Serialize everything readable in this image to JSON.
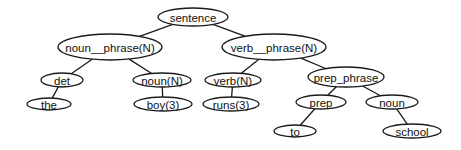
{
  "diagram": {
    "type": "parse-tree",
    "nodes": [
      {
        "id": "sentence",
        "label": "sentence",
        "cx": 193,
        "cy": 17,
        "rx": 35,
        "ry": 9
      },
      {
        "id": "noun_phrase",
        "label": "noun__phrase(N)",
        "cx": 110,
        "cy": 47,
        "rx": 52,
        "ry": 13
      },
      {
        "id": "verb_phrase",
        "label": "verb__phrase(N)",
        "cx": 274,
        "cy": 47,
        "rx": 52,
        "ry": 13
      },
      {
        "id": "det",
        "label": "det",
        "cx": 62,
        "cy": 80,
        "rx": 21,
        "ry": 7
      },
      {
        "id": "noun_n",
        "label": "noun(N)",
        "cx": 162,
        "cy": 80,
        "rx": 29,
        "ry": 7
      },
      {
        "id": "verb_n",
        "label": "verb(N)",
        "cx": 233,
        "cy": 80,
        "rx": 28,
        "ry": 7
      },
      {
        "id": "prep_phrase",
        "label": "prep_phrase",
        "cx": 346,
        "cy": 77,
        "rx": 38,
        "ry": 10
      },
      {
        "id": "the",
        "label": "the",
        "cx": 49,
        "cy": 104,
        "rx": 22,
        "ry": 6
      },
      {
        "id": "boy",
        "label": "boy(3)",
        "cx": 163,
        "cy": 104,
        "rx": 29,
        "ry": 7
      },
      {
        "id": "runs",
        "label": "runs(3)",
        "cx": 231,
        "cy": 104,
        "rx": 28,
        "ry": 7
      },
      {
        "id": "prep",
        "label": "prep",
        "cx": 321,
        "cy": 102,
        "rx": 25,
        "ry": 7
      },
      {
        "id": "noun",
        "label": "noun",
        "cx": 392,
        "cy": 102,
        "rx": 26,
        "ry": 7
      },
      {
        "id": "to",
        "label": "to",
        "cx": 295,
        "cy": 131,
        "rx": 21,
        "ry": 6
      },
      {
        "id": "school",
        "label": "school",
        "cx": 412,
        "cy": 131,
        "rx": 29,
        "ry": 7
      }
    ],
    "edges": [
      [
        "sentence",
        "noun_phrase"
      ],
      [
        "sentence",
        "verb_phrase"
      ],
      [
        "noun_phrase",
        "det"
      ],
      [
        "noun_phrase",
        "noun_n"
      ],
      [
        "verb_phrase",
        "verb_n"
      ],
      [
        "verb_phrase",
        "prep_phrase"
      ],
      [
        "det",
        "the"
      ],
      [
        "noun_n",
        "boy"
      ],
      [
        "verb_n",
        "runs"
      ],
      [
        "prep_phrase",
        "prep"
      ],
      [
        "prep_phrase",
        "noun"
      ],
      [
        "prep",
        "to"
      ],
      [
        "noun",
        "school"
      ]
    ],
    "colors": {
      "stroke": "#1a1a1a",
      "fill": "#ffffff",
      "text": "#111111"
    }
  }
}
